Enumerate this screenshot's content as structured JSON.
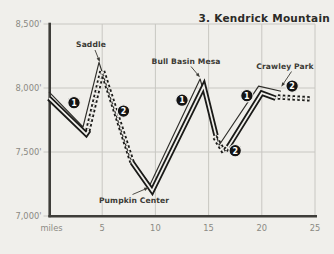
{
  "title": "3. Kendrick Mountain",
  "colors": {
    "paper": "#f0efeb",
    "ink": "#1a1a18",
    "profile": "#2e2d29",
    "grid": "#c8c7c2",
    "axis": "#3e3d39",
    "tick_text": "#8b8a83",
    "label_text": "#3c3b36",
    "badge_fill": "#141414",
    "badge_text": "#ffffff"
  },
  "chart_data": {
    "type": "line",
    "title": "3. Kendrick Mountain",
    "xlabel": "miles",
    "ylabel": "",
    "xlim": [
      0,
      25
    ],
    "ylim": [
      7000,
      8500
    ],
    "grid": true,
    "x_caption": "miles",
    "x_ticks": [
      {
        "label": "5",
        "value": 5
      },
      {
        "label": "10",
        "value": 10
      },
      {
        "label": "15",
        "value": 15
      },
      {
        "label": "20",
        "value": 20
      },
      {
        "label": "25",
        "value": 25
      }
    ],
    "y_ticks": [
      {
        "label": "8,500'",
        "value": 8500
      },
      {
        "label": "8,000'",
        "value": 8000
      },
      {
        "label": "7,500'",
        "value": 7500
      },
      {
        "label": "7,000'",
        "value": 7000
      }
    ],
    "profile_points": [
      [
        0,
        7970
      ],
      [
        3.2,
        7695
      ],
      [
        4.7,
        8200
      ],
      [
        7.6,
        7455
      ],
      [
        9.5,
        7245
      ],
      [
        14.2,
        8070
      ],
      [
        16.0,
        7555
      ],
      [
        19.7,
        8015
      ],
      [
        21.8,
        7975
      ]
    ],
    "trail_segments": [
      {
        "trail": "1",
        "line_style": "solid",
        "points": [
          [
            0,
            7920
          ],
          [
            3.5,
            7640
          ],
          [
            3.75,
            7670
          ]
        ]
      },
      {
        "trail": "2",
        "line_style": "dashed",
        "points": [
          [
            3.65,
            7665
          ],
          [
            5.0,
            8140
          ],
          [
            7.8,
            7420
          ]
        ]
      },
      {
        "trail": "1",
        "line_style": "solid",
        "points": [
          [
            7.8,
            7420
          ],
          [
            9.7,
            7195
          ],
          [
            14.55,
            8015
          ],
          [
            15.7,
            7630
          ]
        ]
      },
      {
        "trail": "2",
        "line_style": "dashed",
        "points": [
          [
            15.6,
            7615
          ],
          [
            16.45,
            7500
          ],
          [
            16.9,
            7545
          ]
        ]
      },
      {
        "trail": "1",
        "line_style": "solid",
        "points": [
          [
            16.85,
            7540
          ],
          [
            20.0,
            7960
          ],
          [
            21.3,
            7920
          ]
        ]
      },
      {
        "trail": "2",
        "line_style": "dashed",
        "points": [
          [
            21.5,
            7930
          ],
          [
            24.6,
            7915
          ]
        ]
      }
    ],
    "trail_badges": [
      {
        "label": "1",
        "mile": 2.35,
        "elev": 7885
      },
      {
        "label": "2",
        "mile": 7.0,
        "elev": 7820
      },
      {
        "label": "1",
        "mile": 12.5,
        "elev": 7905
      },
      {
        "label": "2",
        "mile": 17.5,
        "elev": 7510
      },
      {
        "label": "1",
        "mile": 18.6,
        "elev": 7940
      },
      {
        "label": "2",
        "mile": 22.85,
        "elev": 8015
      }
    ],
    "annotations": [
      {
        "text": "Saddle",
        "mile": 4.7,
        "elev": 8200,
        "tx": 91,
        "ty": 44,
        "arrow": [
          95,
          50,
          99,
          60
        ]
      },
      {
        "text": "Bull Basin Mesa",
        "mile": 14.2,
        "elev": 8070,
        "tx": 186,
        "ty": 61,
        "arrow": [
          191,
          66.5,
          198.5,
          75.5
        ]
      },
      {
        "text": "Crawley Park",
        "mile": 19.7,
        "elev": 8015,
        "tx": 285,
        "ty": 66,
        "arrow": [
          291.5,
          71.5,
          282.5,
          85
        ]
      },
      {
        "text": "Pumpkin Center",
        "mile": 9.5,
        "elev": 7245,
        "tx": 134,
        "ty": 200,
        "arrow": [
          132.5,
          194.5,
          146.5,
          188.5
        ]
      }
    ]
  }
}
